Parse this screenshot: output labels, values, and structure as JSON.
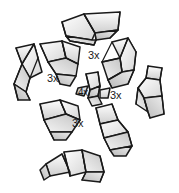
{
  "diagram": {
    "background_color": "#ffffff",
    "outline_color": "#1a1a1a",
    "fill_light": "#fbfbfb",
    "fill_mid": "#e4e4e4",
    "fill_dark": "#c9c9c9",
    "piece_count_total": 16,
    "labels": [
      {
        "id": "qty-top-right",
        "text": "3x",
        "x": 88,
        "y": 55,
        "describes": "upper-right cluster of folded pieces"
      },
      {
        "id": "qty-left",
        "text": "3x",
        "x": 49,
        "y": 78,
        "describes": "left cluster of folded pieces"
      },
      {
        "id": "qty-center",
        "text": "4x",
        "x": 80,
        "y": 93,
        "describes": "center junction pieces"
      },
      {
        "id": "qty-right",
        "text": "3x",
        "x": 110,
        "y": 95,
        "describes": "right cluster of folded pieces"
      },
      {
        "id": "qty-bottom",
        "text": "3x",
        "x": 72,
        "y": 122,
        "describes": "lower cluster of folded pieces"
      }
    ],
    "pieces": [
      {
        "id": "piece-top-center",
        "position": "top-center"
      },
      {
        "id": "piece-upper-left",
        "position": "upper-left"
      },
      {
        "id": "piece-left-outer",
        "position": "left-outer"
      },
      {
        "id": "piece-upper-right",
        "position": "upper-right"
      },
      {
        "id": "piece-right-outer",
        "position": "right-outer"
      },
      {
        "id": "piece-lower-left",
        "position": "lower-left"
      },
      {
        "id": "piece-lower-right",
        "position": "lower-right"
      },
      {
        "id": "piece-bottom-center",
        "position": "bottom-center"
      }
    ]
  }
}
